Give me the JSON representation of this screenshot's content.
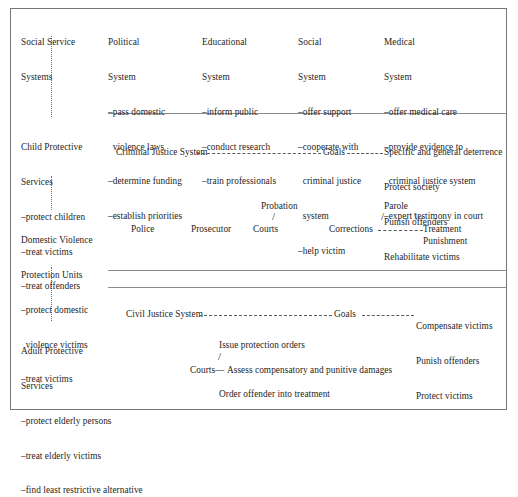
{
  "diagram": {
    "frame_color": "#777777",
    "text_color": "#262626",
    "left_column": {
      "connector": "vertical-dotted-line",
      "groups": [
        {
          "name": "social-service-systems",
          "heading": [
            "Social Service",
            "Systems"
          ],
          "items": []
        },
        {
          "name": "child-protective-services",
          "heading": [
            "Child Protective",
            "Services"
          ],
          "items": [
            "–protect children",
            "–treat victims",
            "–treat offenders"
          ]
        },
        {
          "name": "domestic-violence-protection-units",
          "heading": [
            "Domestic Violence",
            "Protection Units"
          ],
          "items": [
            "–protect domestic",
            "  violence victims",
            "–treat victims"
          ]
        },
        {
          "name": "adult-protective-services",
          "heading": [
            "Adult Protective",
            "Services"
          ],
          "items": [
            "–protect elderly persons",
            "–treat elderly victims",
            "–find least restrictive alternative"
          ]
        }
      ]
    },
    "top_band": {
      "name": "societal-systems-band",
      "systems": [
        {
          "name": "political-system",
          "heading": [
            "Political",
            "System"
          ],
          "items": [
            "–pass domestic",
            "  violence laws",
            "–determine funding",
            "–establish priorities"
          ]
        },
        {
          "name": "educational-system",
          "heading": [
            "Educational",
            "System"
          ],
          "items": [
            "–inform public",
            "–conduct research",
            "–train professionals"
          ]
        },
        {
          "name": "social-system",
          "heading": [
            "Social",
            "System"
          ],
          "items": [
            "–offer support",
            "–cooperate with",
            "  criminal justice",
            "  system",
            "–help victim"
          ]
        },
        {
          "name": "medical-system",
          "heading": [
            "Medical",
            "System"
          ],
          "items": [
            "–offer medical care",
            "–provide evidence to",
            "  criminal justice system",
            "–expert testimony in court"
          ]
        }
      ]
    },
    "criminal_band": {
      "name": "criminal-justice-band",
      "system_label": "Criminal Justice System",
      "goals_label": "Goals",
      "goals": [
        "Specific and general deterrence",
        "Protect society",
        "Punish offenders",
        "Rehabilitate victims"
      ],
      "agencies": {
        "police": "Police",
        "prosecutor": "Prosecutor",
        "courts": "Courts",
        "probation": "Probation",
        "corrections": "Corrections",
        "parole": "Parole",
        "treatment": "Treatment",
        "punishment": "Punishment"
      }
    },
    "civil_band": {
      "name": "civil-justice-band",
      "system_label": "Civil Justice System",
      "goals_label": "Goals",
      "goals": [
        "Compensate victims",
        "Punish offenders",
        "Protect victims"
      ],
      "courts_label": "Courts—",
      "actions": [
        "Issue protection orders",
        "Assess compensatory and punitive damages",
        "Order offender into treatment"
      ]
    }
  }
}
